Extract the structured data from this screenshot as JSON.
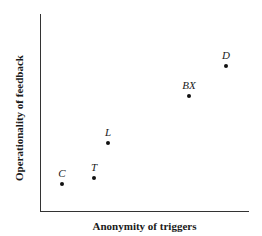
{
  "chart_data": {
    "type": "scatter",
    "title": "",
    "xlabel": "Anonymity of triggers",
    "ylabel": "Operationality of feedback",
    "grid": false,
    "ticks": false,
    "points": [
      {
        "label": "C",
        "x": 0.1,
        "y": 0.14
      },
      {
        "label": "T",
        "x": 0.26,
        "y": 0.17
      },
      {
        "label": "L",
        "x": 0.33,
        "y": 0.35
      },
      {
        "label": "BX",
        "x": 0.72,
        "y": 0.58
      },
      {
        "label": "D",
        "x": 0.89,
        "y": 0.74
      }
    ],
    "xlim": [
      0,
      1
    ],
    "ylim": [
      0,
      1
    ]
  },
  "px": {
    "C": {
      "x": 62,
      "y": 184
    },
    "T": {
      "x": 94,
      "y": 178
    },
    "L": {
      "x": 108,
      "y": 143
    },
    "BX": {
      "x": 189,
      "y": 96
    },
    "D": {
      "x": 226,
      "y": 66
    }
  }
}
